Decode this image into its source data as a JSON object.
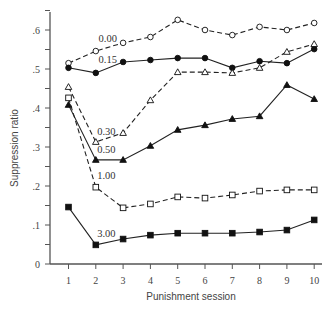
{
  "chart_data": {
    "type": "line",
    "title": "",
    "xlabel": "Punishment session",
    "ylabel": "Suppression ratio",
    "x": [
      1,
      2,
      3,
      4,
      5,
      6,
      7,
      8,
      9,
      10
    ],
    "xlim": [
      0.4,
      10.5
    ],
    "ylim": [
      0,
      0.65
    ],
    "yticks": [
      0,
      0.1,
      0.2,
      0.3,
      0.4,
      0.5,
      0.6
    ],
    "ytick_labels": [
      "0",
      ".1",
      ".2",
      ".3",
      ".4",
      ".5",
      ".6"
    ],
    "grid": false,
    "legend": "inline labels",
    "series": [
      {
        "name": "0.00",
        "marker": "circle-open",
        "line": "dashed",
        "values": [
          0.515,
          0.546,
          0.567,
          0.582,
          0.626,
          0.6,
          0.587,
          0.608,
          0.6,
          0.618
        ],
        "label_pos": [
          2.1,
          0.57
        ]
      },
      {
        "name": "0.15",
        "marker": "circle-filled",
        "line": "solid",
        "values": [
          0.503,
          0.49,
          0.518,
          0.523,
          0.528,
          0.528,
          0.503,
          0.52,
          0.515,
          0.551
        ],
        "label_pos": [
          2.1,
          0.515
        ]
      },
      {
        "name": "0.30",
        "marker": "triangle-open",
        "line": "dashed",
        "values": [
          0.454,
          0.313,
          0.336,
          0.42,
          0.492,
          0.492,
          0.49,
          0.503,
          0.544,
          0.564
        ],
        "label_pos": [
          2.05,
          0.33
        ]
      },
      {
        "name": "0.50",
        "marker": "triangle-filled",
        "line": "solid",
        "values": [
          0.408,
          0.267,
          0.267,
          0.303,
          0.344,
          0.356,
          0.372,
          0.379,
          0.459,
          0.423
        ],
        "label_pos": [
          2.05,
          0.285
        ]
      },
      {
        "name": "1.00",
        "marker": "square-open",
        "line": "dashed",
        "values": [
          0.426,
          0.197,
          0.144,
          0.154,
          0.172,
          0.169,
          0.177,
          0.187,
          0.19,
          0.19
        ],
        "label_pos": [
          2.05,
          0.218
        ]
      },
      {
        "name": "3.00",
        "marker": "square-filled",
        "line": "solid",
        "values": [
          0.146,
          0.049,
          0.064,
          0.074,
          0.079,
          0.079,
          0.079,
          0.082,
          0.087,
          0.113
        ],
        "label_pos": [
          2.05,
          0.068
        ]
      }
    ]
  }
}
